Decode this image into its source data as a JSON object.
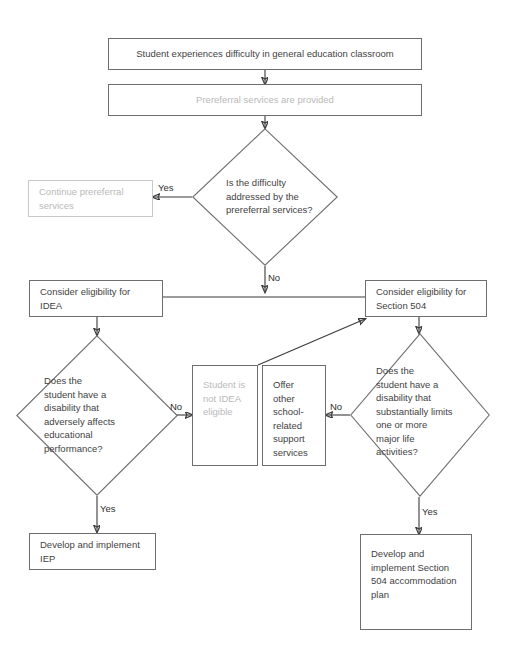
{
  "diagram": {
    "type": "flowchart",
    "canvas": {
      "width": 515,
      "height": 653,
      "background": "#ffffff"
    },
    "colors": {
      "box_border": "#6e6e6e",
      "faded_border": "#c9c9c9",
      "text": "#3f3f3f",
      "faded_text": "#b9b9b9",
      "connector": "#3a3a3a"
    },
    "nodes": [
      {
        "id": "start",
        "shape": "rectangle",
        "text": "Student experiences difficulty in general education classroom"
      },
      {
        "id": "prereferral",
        "shape": "rectangle",
        "text": "Prereferral services are provided"
      },
      {
        "id": "difficulty-decision",
        "shape": "diamond",
        "text": "Is the difficulty\naddressed by the\nprereferral services?"
      },
      {
        "id": "continue-prereferral",
        "shape": "rectangle",
        "text": "Continue prereferral services"
      },
      {
        "id": "consider-idea",
        "shape": "rectangle",
        "text": "Consider eligibility for IDEA"
      },
      {
        "id": "consider-504",
        "shape": "rectangle",
        "text": "Consider eligibility for Section 504"
      },
      {
        "id": "idea-decision",
        "shape": "diamond",
        "text": "Does the\nstudent have a\ndisability that\nadversely affects\neducational\nperformance?"
      },
      {
        "id": "not-idea-eligible",
        "shape": "rectangle",
        "text": "Student is not IDEA eligible"
      },
      {
        "id": "offer-other-support",
        "shape": "rectangle",
        "text": "Offer other school-related support services"
      },
      {
        "id": "section504-decision",
        "shape": "diamond",
        "text": "Does the\nstudent have a\ndisability that\nsubstantially limits\none or more\nmajor life\nactivities?"
      },
      {
        "id": "develop-iep",
        "shape": "rectangle",
        "text": "Develop and implement IEP"
      },
      {
        "id": "develop-504-plan",
        "shape": "rectangle",
        "text": "Develop and implement Section 504 accommodation plan"
      }
    ],
    "edge_labels": {
      "difficulty_yes": "Yes",
      "difficulty_no": "No",
      "idea_no": "No",
      "idea_yes": "Yes",
      "s504_no": "No",
      "s504_yes": "Yes"
    },
    "edges": [
      {
        "from": "start",
        "to": "prereferral",
        "label": ""
      },
      {
        "from": "prereferral",
        "to": "difficulty-decision",
        "label": ""
      },
      {
        "from": "difficulty-decision",
        "to": "continue-prereferral",
        "label": "Yes"
      },
      {
        "from": "difficulty-decision",
        "to": "consider-idea",
        "label": "No"
      },
      {
        "from": "difficulty-decision",
        "to": "consider-504",
        "label": "No"
      },
      {
        "from": "consider-idea",
        "to": "idea-decision",
        "label": ""
      },
      {
        "from": "consider-504",
        "to": "section504-decision",
        "label": ""
      },
      {
        "from": "idea-decision",
        "to": "not-idea-eligible",
        "label": "No"
      },
      {
        "from": "idea-decision",
        "to": "develop-iep",
        "label": "Yes"
      },
      {
        "from": "section504-decision",
        "to": "offer-other-support",
        "label": "No"
      },
      {
        "from": "section504-decision",
        "to": "develop-504-plan",
        "label": "Yes"
      },
      {
        "from": "offer-other-support",
        "to": "consider-504",
        "label": ""
      }
    ]
  }
}
